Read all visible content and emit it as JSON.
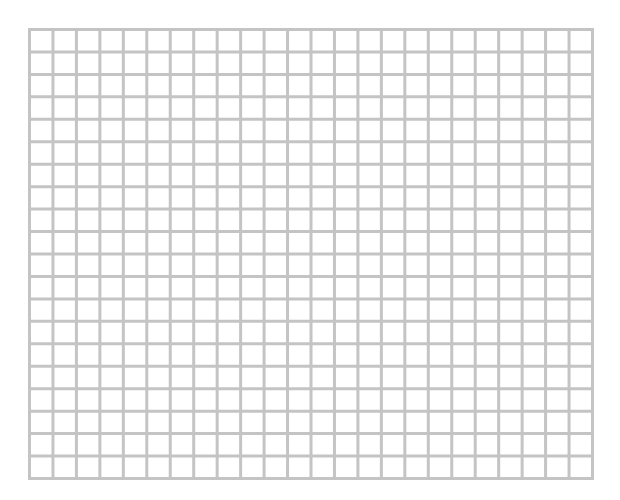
{
  "grid": {
    "columns": 24,
    "rows": 20,
    "line_color": "#c4c4c4",
    "background_color": "#ffffff",
    "line_width": 3
  }
}
